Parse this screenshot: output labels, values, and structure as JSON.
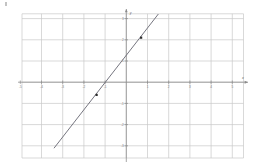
{
  "figure": {
    "background_color": "#ffffff",
    "grid_color": "#c9c9c9",
    "axis_color": "#8a8a8a",
    "line_color": "#6e6e78",
    "point_color": "#2b2b2b",
    "label_color": "#7d7d7d",
    "speck_name": "scan-artifact"
  },
  "chart_data": {
    "type": "line",
    "title": "",
    "xlabel": "x",
    "ylabel": "y",
    "grid": true,
    "legend": "none",
    "xlim": [
      -5,
      5
    ],
    "ylim": [
      -4,
      4
    ],
    "xticks": [
      -5,
      -4,
      -3,
      -2,
      -1,
      1,
      2,
      3,
      4,
      5
    ],
    "yticks": [
      -4,
      -3,
      -2,
      -1,
      1,
      2,
      3,
      4
    ],
    "xtick_labels": [
      "-5",
      "-4",
      "-3",
      "-2",
      "-1",
      "1",
      "2",
      "3",
      "4",
      "5"
    ],
    "ytick_labels": [
      "-4",
      "-3",
      "-2",
      "-1",
      "1",
      "2",
      "3",
      "4"
    ],
    "series": [
      {
        "name": "line",
        "kind": "straight-line",
        "slope": 1.3,
        "intercept": 1.3,
        "x": [
          -3.4,
          1.5
        ],
        "y": [
          -3.1,
          3.2
        ]
      }
    ],
    "points": [
      {
        "label": "",
        "x": -1.4,
        "y": -0.6
      },
      {
        "label": "",
        "x": 0.7,
        "y": 2.1
      }
    ]
  }
}
